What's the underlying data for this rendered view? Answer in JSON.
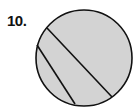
{
  "problem": {
    "number_label": "10."
  },
  "figure": {
    "type": "circle-with-chords",
    "fill": "#d3d3d3",
    "stroke": "#111111",
    "circle": {
      "cx": 84,
      "cy": 58,
      "r": 48
    },
    "chords": [
      {
        "x1": 47,
        "y1": 28,
        "x2": 112,
        "y2": 97
      },
      {
        "x1": 37,
        "y1": 45,
        "x2": 75,
        "y2": 104
      }
    ]
  }
}
